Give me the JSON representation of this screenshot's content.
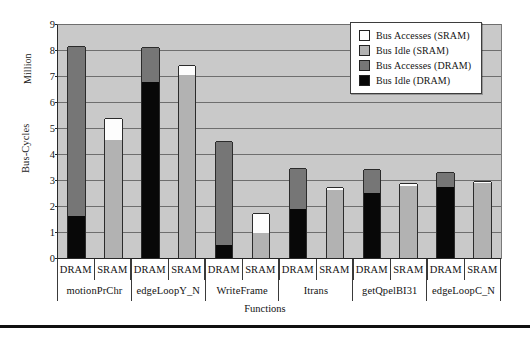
{
  "chart_data": {
    "type": "bar",
    "title": "",
    "xlabel": "Functions",
    "ylabel": "Bus-Cycles",
    "unit_label": "Million",
    "ylim": [
      0,
      9
    ],
    "yticks": [
      0,
      1,
      2,
      3,
      4,
      5,
      6,
      7,
      8,
      9
    ],
    "grid": true,
    "stacked": true,
    "legend_position": "top-right",
    "legend": [
      {
        "label": "Bus Accesses (SRAM)",
        "color": "#ffffff",
        "key": "acc_sram"
      },
      {
        "label": "Bus Idle (SRAM)",
        "color": "#b2b2b2",
        "key": "idle_sram"
      },
      {
        "label": "Bus Accesses (DRAM)",
        "color": "#767676",
        "key": "acc_dram"
      },
      {
        "label": "Bus Idle (DRAM)",
        "color": "#080808",
        "key": "idle_dram"
      }
    ],
    "memory_labels": [
      "DRAM",
      "SRAM"
    ],
    "categories": [
      "motionPrChr",
      "edgeLoopY_N",
      "WriteFrame",
      "Itrans",
      "getQpelBI31",
      "edgeLoopC_N"
    ],
    "bars": [
      {
        "function": "motionPrChr",
        "memory": "DRAM",
        "idle": 1.6,
        "accesses": 6.55,
        "total": 8.15
      },
      {
        "function": "motionPrChr",
        "memory": "SRAM",
        "idle": 4.55,
        "accesses": 0.82,
        "total": 5.37
      },
      {
        "function": "edgeLoopY_N",
        "memory": "DRAM",
        "idle": 6.78,
        "accesses": 1.32,
        "total": 8.1
      },
      {
        "function": "edgeLoopY_N",
        "memory": "SRAM",
        "idle": 7.05,
        "accesses": 0.37,
        "total": 7.42
      },
      {
        "function": "WriteFrame",
        "memory": "DRAM",
        "idle": 0.5,
        "accesses": 4.0,
        "total": 4.5
      },
      {
        "function": "WriteFrame",
        "memory": "SRAM",
        "idle": 0.95,
        "accesses": 0.77,
        "total": 1.72
      },
      {
        "function": "Itrans",
        "memory": "DRAM",
        "idle": 1.9,
        "accesses": 1.57,
        "total": 3.47
      },
      {
        "function": "Itrans",
        "memory": "SRAM",
        "idle": 2.62,
        "accesses": 0.13,
        "total": 2.75
      },
      {
        "function": "getQpelBI31",
        "memory": "DRAM",
        "idle": 2.5,
        "accesses": 0.92,
        "total": 3.42
      },
      {
        "function": "getQpelBI31",
        "memory": "SRAM",
        "idle": 2.78,
        "accesses": 0.1,
        "total": 2.88
      },
      {
        "function": "edgeLoopC_N",
        "memory": "DRAM",
        "idle": 2.73,
        "accesses": 0.59,
        "total": 3.32
      },
      {
        "function": "edgeLoopC_N",
        "memory": "SRAM",
        "idle": 2.88,
        "accesses": 0.1,
        "total": 2.98
      }
    ]
  }
}
